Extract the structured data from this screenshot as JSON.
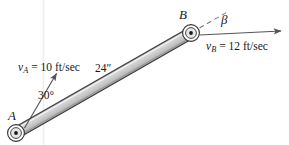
{
  "figure": {
    "background_color": "#ffffff",
    "width": 289,
    "height": 145
  },
  "points": {
    "a": {
      "label": "A",
      "name": "pin-joint-a",
      "x": 16,
      "y": 133
    },
    "b": {
      "label": "B",
      "name": "pin-joint-b",
      "x": 191,
      "y": 33
    }
  },
  "bar": {
    "name": "rigid-bar-ab",
    "length_label": "24″",
    "fill_color": "#c9c9c9",
    "edge_color": "#3a3a3a"
  },
  "velocity_a": {
    "symbol": "v",
    "subscript": "A",
    "equals": " = ",
    "value": "10 ft/sec",
    "full_text": "v_A = 10 ft/sec",
    "arrow_color": "#555555"
  },
  "velocity_b": {
    "symbol": "v",
    "subscript": "B",
    "equals": " = ",
    "value": "12 ft/sec",
    "full_text": "v_B = 12 ft/sec",
    "arrow_color": "#555555"
  },
  "angles": {
    "theta": {
      "label": "30°",
      "name": "angle-30-degrees"
    },
    "beta": {
      "label": "β",
      "name": "angle-beta"
    }
  },
  "guides": {
    "dashed_extension_color": "#777777",
    "faint_vertical_color": "#ececec"
  }
}
